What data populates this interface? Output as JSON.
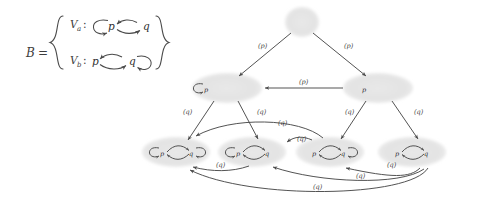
{
  "figure": {
    "kind": "transition-system-lattice-diagram",
    "background": "#ffffff",
    "ink": "#4a4a4a",
    "node_fill": "#e2e2e2",
    "width": 477,
    "height": 200
  },
  "definition": {
    "name": "B",
    "equals": "=",
    "open_brace": "{",
    "close_brace": "}",
    "rows": [
      {
        "id": "Va",
        "name": "V",
        "sub": "a",
        "colon": ":",
        "left_state": "p",
        "right_state": "q",
        "self_loop_on": "p",
        "edges": "p<->q"
      },
      {
        "id": "Vb",
        "name": "V",
        "sub": "b",
        "colon": ":",
        "left_state": "p",
        "right_state": "q",
        "self_loop_on": "q",
        "edges": "p<->q"
      }
    ]
  },
  "graph": {
    "edge_label_p": "(p)",
    "edge_label_q": "(q)",
    "state_p": "p",
    "state_q": "q",
    "nodes": [
      {
        "id": "top",
        "level": 0,
        "cx": 302,
        "cy": 22,
        "rx": 17,
        "ry": 15,
        "states": [],
        "self_loops": [],
        "pair_edge": false
      },
      {
        "id": "m1",
        "level": 1,
        "cx": 227,
        "cy": 88,
        "rx": 33,
        "ry": 15,
        "states": [
          "p"
        ],
        "self_loops": [
          "p"
        ],
        "pair_edge": false
      },
      {
        "id": "m2",
        "level": 1,
        "cx": 378,
        "cy": 88,
        "rx": 33,
        "ry": 15,
        "states": [
          "p"
        ],
        "self_loops": [],
        "pair_edge": false
      },
      {
        "id": "b1",
        "level": 2,
        "cx": 176,
        "cy": 152,
        "rx": 33,
        "ry": 15,
        "states": [
          "p",
          "q"
        ],
        "self_loops": [
          "p",
          "q"
        ],
        "pair_edge": true
      },
      {
        "id": "b2",
        "level": 2,
        "cx": 252,
        "cy": 152,
        "rx": 33,
        "ry": 15,
        "states": [
          "p",
          "q"
        ],
        "self_loops": [
          "p"
        ],
        "pair_edge": true
      },
      {
        "id": "b3",
        "level": 2,
        "cx": 330,
        "cy": 152,
        "rx": 33,
        "ry": 15,
        "states": [
          "p",
          "q"
        ],
        "self_loops": [
          "q"
        ],
        "pair_edge": true
      },
      {
        "id": "b4",
        "level": 2,
        "cx": 412,
        "cy": 152,
        "rx": 33,
        "ry": 15,
        "states": [
          "p",
          "q"
        ],
        "self_loops": [],
        "pair_edge": true
      }
    ],
    "edges": [
      {
        "from": "top",
        "to": "m1",
        "label": "(p)",
        "label_x": 258,
        "label_y": 48
      },
      {
        "from": "top",
        "to": "m2",
        "label": "(p)",
        "label_x": 348,
        "label_y": 48
      },
      {
        "from": "m2",
        "to": "m1",
        "label": "(p)",
        "label_x": 305,
        "label_y": 85
      },
      {
        "from": "m1",
        "to": "b1",
        "label": "(q)",
        "label_x": 184,
        "label_y": 113
      },
      {
        "from": "m1",
        "to": "b2",
        "label": "(q)",
        "label_x": 260,
        "label_y": 113
      },
      {
        "from": "m2",
        "to": "b3",
        "label": "(q)",
        "label_x": 348,
        "label_y": 113
      },
      {
        "from": "m2",
        "to": "b4",
        "label": "(q)",
        "label_x": 418,
        "label_y": 113
      },
      {
        "from": "b3",
        "to": "b1",
        "label": "(q)",
        "label_x": 282,
        "label_y": 126,
        "curve": "above"
      },
      {
        "from": "b3",
        "to": "b2",
        "label": "(q)",
        "label_x": 302,
        "label_y": 142,
        "curve": "above"
      },
      {
        "from": "b4",
        "to": "b1",
        "label": "(q)",
        "label_x": 221,
        "label_y": 166,
        "curve": "below"
      },
      {
        "from": "b4",
        "to": "b2",
        "label": "(q)",
        "label_x": 361,
        "label_y": 177,
        "curve": "below"
      },
      {
        "from": "b4",
        "to": "b3",
        "label": "(q)",
        "label_x": 392,
        "label_y": 166,
        "curve": "below"
      },
      {
        "from": "b4",
        "to": "b1",
        "label": "(q)",
        "label_x": 318,
        "label_y": 186,
        "curve": "below-far"
      }
    ]
  }
}
